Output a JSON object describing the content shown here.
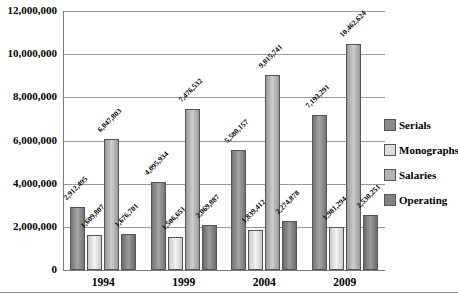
{
  "chart_data": {
    "type": "bar",
    "categories": [
      "1994",
      "1999",
      "2004",
      "2009"
    ],
    "series": [
      {
        "name": "Serials",
        "values": [
          2912495,
          4095934,
          5580157,
          7193291
        ],
        "labels": [
          "2,912,495",
          "4,095,934",
          "5,580,157",
          "7,193,291"
        ],
        "color_edge": "#757575",
        "color_center": "#a5a5a5",
        "legend_color": "#8a8a8a"
      },
      {
        "name": "Monographs",
        "values": [
          1609807,
          1506651,
          1839412,
          1981294
        ],
        "labels": [
          "1,609,807",
          "1,506,651",
          "1,839,412",
          "1,981,294"
        ],
        "color_edge": "#c9c9c9",
        "color_center": "#f3f3f3",
        "legend_color": "#dcdcdc"
      },
      {
        "name": "Salaries",
        "values": [
          6047803,
          7476532,
          9015741,
          10462624
        ],
        "labels": [
          "6,047,803",
          "7,476,532",
          "9,015,741",
          "10,462,624"
        ],
        "color_edge": "#9a9a9a",
        "color_center": "#cdcdcd",
        "legend_color": "#b3b3b3"
      },
      {
        "name": "Operating",
        "values": [
          1676701,
          2069887,
          2274878,
          2530251
        ],
        "labels": [
          "1,676,701",
          "2,069,887",
          "2,274,878",
          "2,530,251"
        ],
        "color_edge": "#6b6b6b",
        "color_center": "#9a9a9a",
        "legend_color": "#818181"
      }
    ],
    "ylim": [
      0,
      12000000
    ],
    "yticks": [
      {
        "value": 0,
        "label": "0"
      },
      {
        "value": 2000000,
        "label": "2,000,000"
      },
      {
        "value": 4000000,
        "label": "4,000,000"
      },
      {
        "value": 6000000,
        "label": "6,000,000"
      },
      {
        "value": 8000000,
        "label": "8,000,000"
      },
      {
        "value": 10000000,
        "label": "10,000,000"
      },
      {
        "value": 12000000,
        "label": "12,000,000"
      }
    ],
    "grid": true,
    "legend_position": "right",
    "bar_style": "grayscale gradient columns with dark outlines, rotated value labels"
  }
}
